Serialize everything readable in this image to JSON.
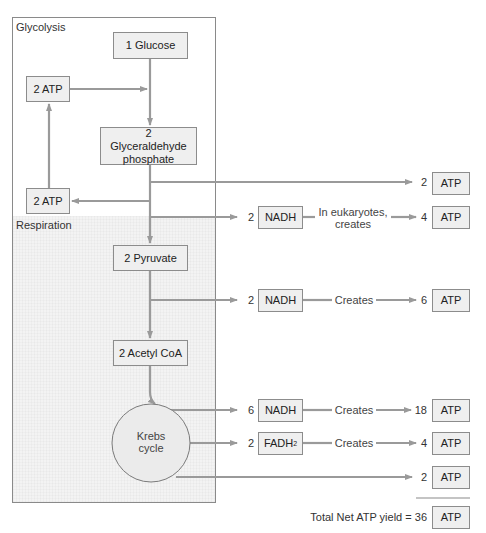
{
  "sections": {
    "glycolysis": "Glycolysis",
    "respiration": "Respiration"
  },
  "pathway": {
    "glucose": "1 Glucose",
    "atp_input": "2 ATP",
    "g3p": "2 Glyceraldehyde phosphate",
    "atp_return": "2 ATP",
    "pyruvate": "2 Pyruvate",
    "acetyl_coa": "2 Acetyl CoA",
    "krebs": "Krebs cycle"
  },
  "outputs": [
    {
      "count": "2",
      "carrier": null,
      "via": null,
      "atp_count": "2",
      "atp_label": "ATP"
    },
    {
      "count": "2",
      "carrier": "NADH",
      "via": "In eukaryotes, creates",
      "atp_count": "4",
      "atp_label": "ATP"
    },
    {
      "count": "2",
      "carrier": "NADH",
      "via": "Creates",
      "atp_count": "6",
      "atp_label": "ATP"
    },
    {
      "count": "6",
      "carrier": "NADH",
      "via": "Creates",
      "atp_count": "18",
      "atp_label": "ATP"
    },
    {
      "count": "2",
      "carrier": "FADH",
      "carrier_sub": "2",
      "via": "Creates",
      "atp_count": "4",
      "atp_label": "ATP"
    },
    {
      "count": "2",
      "carrier": null,
      "via": null,
      "atp_count": "2",
      "atp_label": "ATP"
    }
  ],
  "total": {
    "label": "Total Net ATP yield = 36",
    "atp_label": "ATP"
  },
  "colors": {
    "arrow": "#9a9a9a",
    "box_fill": "#efefef",
    "box_border": "#8c8c8c",
    "respiration_bg": "#f3f3f3"
  }
}
